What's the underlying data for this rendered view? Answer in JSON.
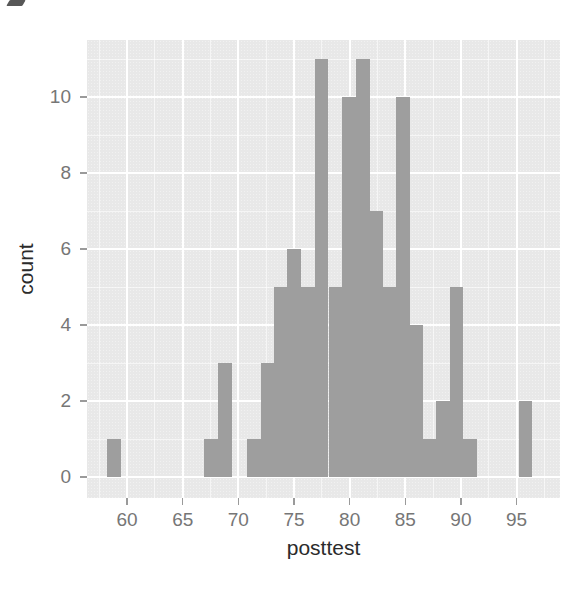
{
  "figure": {
    "background_color": "#ffffff",
    "has_title": false
  },
  "colors": {
    "panel_background": "#ebebeb",
    "bar_fill": "#9e9e9e",
    "grid_major": "#ffffff",
    "grid_minor": "#f6f6f6",
    "tick_label": "#767676",
    "axis_title": "#2b2b2b",
    "tick_mark": "#9a9a9a"
  },
  "chart_data": {
    "type": "bar",
    "subtype": "histogram",
    "title": "",
    "xlabel": "posttest",
    "ylabel": "count",
    "xlim": [
      56.4,
      98.9
    ],
    "ylim": [
      -0.55,
      11.5
    ],
    "x_major_ticks": [
      60,
      65,
      70,
      75,
      80,
      85,
      90,
      95
    ],
    "x_tick_labels": [
      "60",
      "65",
      "70",
      "75",
      "80",
      "85",
      "90",
      "95"
    ],
    "y_major_ticks": [
      0,
      2,
      4,
      6,
      8,
      10
    ],
    "y_tick_labels": [
      "0",
      "2",
      "4",
      "6",
      "8",
      "10"
    ],
    "x_minor_ticks": [
      57.5,
      62.5,
      67.5,
      72.5,
      77.5,
      82.5,
      87.5,
      92.5,
      97.5
    ],
    "y_minor_ticks": [
      1,
      3,
      5,
      7,
      9,
      11
    ],
    "binwidth": 1.27,
    "grid": true,
    "legend": "none",
    "bars": [
      {
        "x0": 58.2,
        "x1": 59.5,
        "count": 1
      },
      {
        "x0": 66.9,
        "x1": 68.2,
        "count": 1
      },
      {
        "x0": 68.2,
        "x1": 69.4,
        "count": 3
      },
      {
        "x0": 70.8,
        "x1": 72.0,
        "count": 1
      },
      {
        "x0": 72.0,
        "x1": 73.2,
        "count": 3
      },
      {
        "x0": 73.2,
        "x1": 74.4,
        "count": 5
      },
      {
        "x0": 74.4,
        "x1": 75.6,
        "count": 6
      },
      {
        "x0": 75.6,
        "x1": 76.9,
        "count": 5
      },
      {
        "x0": 76.9,
        "x1": 78.1,
        "count": 11
      },
      {
        "x0": 78.1,
        "x1": 79.3,
        "count": 5
      },
      {
        "x0": 79.3,
        "x1": 80.6,
        "count": 10
      },
      {
        "x0": 80.6,
        "x1": 81.8,
        "count": 11
      },
      {
        "x0": 81.8,
        "x1": 83.0,
        "count": 7
      },
      {
        "x0": 83.0,
        "x1": 84.2,
        "count": 5
      },
      {
        "x0": 84.2,
        "x1": 85.4,
        "count": 10
      },
      {
        "x0": 85.4,
        "x1": 86.6,
        "count": 4
      },
      {
        "x0": 86.6,
        "x1": 87.8,
        "count": 1
      },
      {
        "x0": 87.8,
        "x1": 89.0,
        "count": 2
      },
      {
        "x0": 89.0,
        "x1": 90.2,
        "count": 5
      },
      {
        "x0": 90.2,
        "x1": 91.4,
        "count": 1
      },
      {
        "x0": 95.2,
        "x1": 96.4,
        "count": 2
      }
    ]
  }
}
